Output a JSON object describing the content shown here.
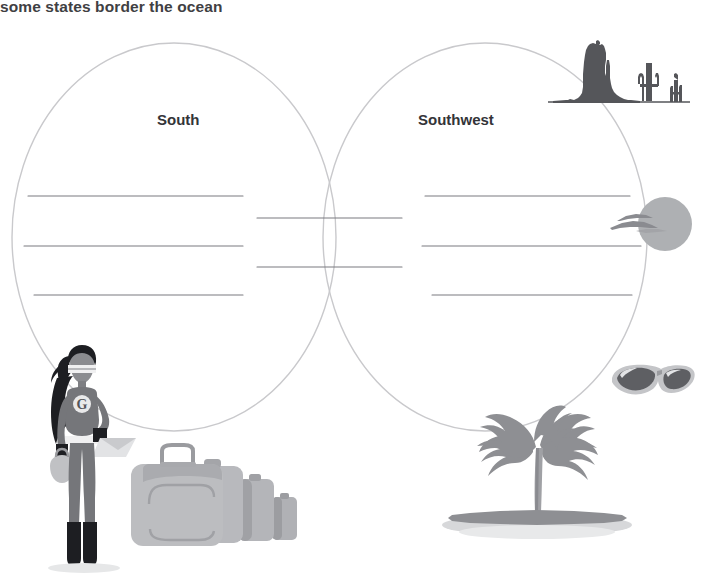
{
  "worksheet": {
    "title": "some states border the ocean",
    "title_color": "#3f4043"
  },
  "venn": {
    "left_label": "South",
    "right_label": "Southwest",
    "outline_color": "#c9c9cc",
    "line_color": "#7b7b80",
    "left_lines": 3,
    "center_lines": 2,
    "right_lines": 3
  },
  "illustrations": {
    "mesa": "mesa-butte-icon",
    "cactus_large": "saguaro-cactus-icon",
    "cactus_small": "saguaro-cactus-small-icon",
    "sun": "sun-icon",
    "birds": "flying-birds-icon",
    "sunglasses": "sunglasses-icon",
    "palm_tree": "palm-tree-island-icon",
    "traveler": "superhero-traveler-figure",
    "luggage": "luggage-set-icon",
    "chest_emblem": "G"
  },
  "colors": {
    "dark_gray": "#55565a",
    "mid_gray": "#8a8b90",
    "light_gray": "#b9babd",
    "pale_gray": "#d2d3d6",
    "outline": "#c9c9cc"
  }
}
